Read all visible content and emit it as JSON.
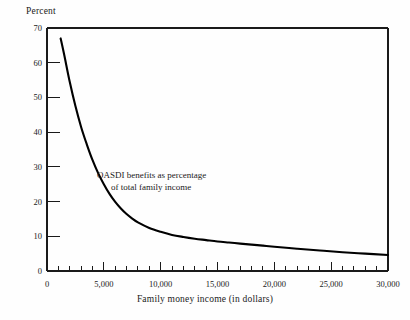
{
  "chart_data": {
    "type": "line",
    "title": "",
    "xlabel": "Family money income (in dollars)",
    "ylabel": "Percent",
    "xlim": [
      0,
      30000
    ],
    "ylim": [
      0,
      70
    ],
    "grid": false,
    "legend": "none",
    "annotations": [
      {
        "line1": "OASDI benefits as percentage",
        "line2": "of total family income",
        "x": 4500,
        "y": 27
      }
    ],
    "x_ticks_major": [
      0,
      5000,
      10000,
      15000,
      20000,
      25000,
      30000
    ],
    "x_tick_labels": [
      "0",
      "5,000",
      "10,000",
      "15,000",
      "20,000",
      "25,000",
      "30,000"
    ],
    "x_tick_minor_step": 1000,
    "y_ticks_major": [
      0,
      10,
      20,
      30,
      40,
      50,
      60,
      70
    ],
    "y_tick_labels": [
      "0",
      "10",
      "20",
      "30",
      "40",
      "50",
      "60",
      "70"
    ],
    "series": [
      {
        "name": "OASDI benefits as percentage of total family income",
        "color": "#000000",
        "x": [
          1200,
          1500,
          2000,
          2500,
          3000,
          3500,
          4000,
          4500,
          5000,
          5500,
          6000,
          6500,
          7000,
          7500,
          8000,
          9000,
          10000,
          11000,
          12000,
          13000,
          14000,
          15000,
          16000,
          17000,
          18000,
          19000,
          20000,
          22000,
          24000,
          26000,
          28000,
          30000
        ],
        "values": [
          67.0,
          62.5,
          54.5,
          47.5,
          41.5,
          36.5,
          32.0,
          28.2,
          25.0,
          22.2,
          19.9,
          18.0,
          16.4,
          15.1,
          14.0,
          12.4,
          11.3,
          10.4,
          9.8,
          9.3,
          8.9,
          8.5,
          8.2,
          7.9,
          7.6,
          7.3,
          7.0,
          6.4,
          5.9,
          5.4,
          5.0,
          4.6
        ]
      }
    ]
  },
  "plot_geometry": {
    "left": 47,
    "right": 388,
    "top": 28,
    "bottom": 271
  },
  "styles": {
    "line_color": "#000000",
    "axis_color": "#1a1a1a",
    "background": "#fefefe"
  }
}
